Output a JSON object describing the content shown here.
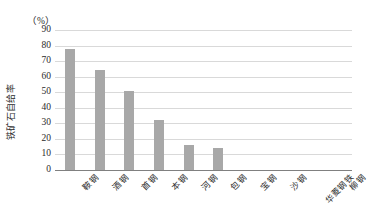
{
  "chart_data": {
    "type": "bar",
    "title": "",
    "subtitle": "",
    "xlabel": "",
    "ylabel": "铁矿石自给率",
    "unit_label": "（%）",
    "categories": [
      "鞍钢",
      "酒钢",
      "首钢",
      "本钢",
      "河钢",
      "包钢",
      "宝钢",
      "沙钢",
      "华菱钢铁",
      "柳钢"
    ],
    "values": [
      78,
      64,
      51,
      32,
      16,
      14,
      0,
      0,
      0,
      0
    ],
    "ylim": [
      0,
      90
    ],
    "ytick_values": [
      0,
      10,
      20,
      30,
      40,
      50,
      60,
      70,
      80,
      90
    ],
    "ytick_labels": [
      "0",
      "10",
      "20",
      "30",
      "40",
      "50",
      "60",
      "70",
      "80",
      "90"
    ],
    "grid": "horizontal",
    "legend": "none",
    "series": [
      {
        "name": "铁矿石自给率",
        "values": [
          78,
          64,
          51,
          32,
          16,
          14,
          0,
          0,
          0,
          0
        ]
      }
    ],
    "colors": {
      "bar": "#a8a8a8",
      "gridline": "#d9d9d9",
      "axis": "#808080",
      "text": "#2b2b2b",
      "background": "#ffffff"
    }
  }
}
